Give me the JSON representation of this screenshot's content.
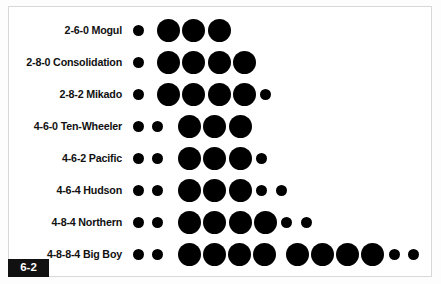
{
  "figure": {
    "badge_label": "6-2",
    "caption_kind": "figure-number-badge",
    "panel_background": "#ffffff",
    "panel_border_color": "#d8d8d8",
    "wheel_color": "#000000",
    "text_color": "#111111"
  },
  "chart_data": {
    "type": "scatter",
    "title": "",
    "subtitle": "",
    "xlabel": "",
    "ylabel": "",
    "legend": [],
    "categories": [
      "2-6-0 Mogul",
      "2-8-0 Consolidation",
      "2-8-2 Mikado",
      "4-6-0 Ten-Wheeler",
      "4-6-2 Pacific",
      "4-6-4 Hudson",
      "4-8-4 Northern",
      "4-8-8-4 Big Boy"
    ],
    "rows": [
      {
        "label": "2-6-0 Mogul",
        "whyte": "2-6-0",
        "leading": 1,
        "driving": 3,
        "trailing": 0,
        "wheels": [
          {
            "size": "small",
            "x": 7
          },
          {
            "size": "large",
            "x": 31
          },
          {
            "size": "large",
            "x": 56
          },
          {
            "size": "large",
            "x": 82
          }
        ]
      },
      {
        "label": "2-8-0 Consolidation",
        "whyte": "2-8-0",
        "leading": 1,
        "driving": 4,
        "trailing": 0,
        "wheels": [
          {
            "size": "small",
            "x": 7
          },
          {
            "size": "large",
            "x": 31
          },
          {
            "size": "large",
            "x": 56
          },
          {
            "size": "large",
            "x": 82
          },
          {
            "size": "large",
            "x": 107
          }
        ]
      },
      {
        "label": "2-8-2 Mikado",
        "whyte": "2-8-2",
        "leading": 1,
        "driving": 4,
        "trailing": 1,
        "wheels": [
          {
            "size": "small",
            "x": 7
          },
          {
            "size": "large",
            "x": 31
          },
          {
            "size": "large",
            "x": 56
          },
          {
            "size": "large",
            "x": 82
          },
          {
            "size": "large",
            "x": 107
          },
          {
            "size": "small",
            "x": 134
          }
        ]
      },
      {
        "label": "4-6-0 Ten-Wheeler",
        "whyte": "4-6-0",
        "leading": 2,
        "driving": 3,
        "trailing": 0,
        "wheels": [
          {
            "size": "small",
            "x": 7
          },
          {
            "size": "small",
            "x": 26
          },
          {
            "size": "large",
            "x": 52
          },
          {
            "size": "large",
            "x": 77
          },
          {
            "size": "large",
            "x": 103
          }
        ]
      },
      {
        "label": "4-6-2 Pacific",
        "whyte": "4-6-2",
        "leading": 2,
        "driving": 3,
        "trailing": 1,
        "wheels": [
          {
            "size": "small",
            "x": 7
          },
          {
            "size": "small",
            "x": 26
          },
          {
            "size": "large",
            "x": 52
          },
          {
            "size": "large",
            "x": 77
          },
          {
            "size": "large",
            "x": 103
          },
          {
            "size": "small",
            "x": 130
          }
        ]
      },
      {
        "label": "4-6-4 Hudson",
        "whyte": "4-6-4",
        "leading": 2,
        "driving": 3,
        "trailing": 2,
        "wheels": [
          {
            "size": "small",
            "x": 7
          },
          {
            "size": "small",
            "x": 26
          },
          {
            "size": "large",
            "x": 52
          },
          {
            "size": "large",
            "x": 77
          },
          {
            "size": "large",
            "x": 103
          },
          {
            "size": "small",
            "x": 130
          },
          {
            "size": "small",
            "x": 150
          }
        ]
      },
      {
        "label": "4-8-4 Northern",
        "whyte": "4-8-4",
        "leading": 2,
        "driving": 4,
        "trailing": 2,
        "wheels": [
          {
            "size": "small",
            "x": 7
          },
          {
            "size": "small",
            "x": 26
          },
          {
            "size": "large",
            "x": 52
          },
          {
            "size": "large",
            "x": 77
          },
          {
            "size": "large",
            "x": 103
          },
          {
            "size": "large",
            "x": 128
          },
          {
            "size": "small",
            "x": 155
          },
          {
            "size": "small",
            "x": 175
          }
        ]
      },
      {
        "label": "4-8-8-4 Big Boy",
        "whyte": "4-8-8-4",
        "leading": 2,
        "driving": 8,
        "trailing": 2,
        "wheels": [
          {
            "size": "small",
            "x": 7
          },
          {
            "size": "small",
            "x": 26
          },
          {
            "size": "large",
            "x": 52
          },
          {
            "size": "large",
            "x": 77
          },
          {
            "size": "large",
            "x": 102
          },
          {
            "size": "large",
            "x": 127
          },
          {
            "size": "large",
            "x": 160
          },
          {
            "size": "large",
            "x": 185
          },
          {
            "size": "large",
            "x": 210
          },
          {
            "size": "large",
            "x": 235
          },
          {
            "size": "small",
            "x": 263
          },
          {
            "size": "small",
            "x": 282
          }
        ]
      }
    ],
    "row_tops": [
      14,
      46,
      78,
      110,
      142,
      174,
      206,
      238
    ]
  }
}
